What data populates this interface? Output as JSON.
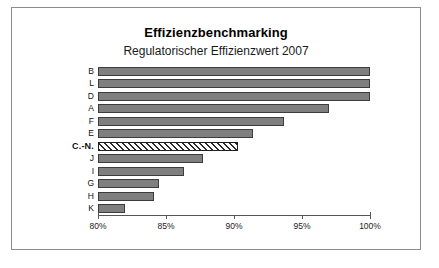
{
  "chart_data": {
    "type": "bar",
    "orientation": "horizontal",
    "title": "Effizienzbenchmarking",
    "subtitle": "Regulatorischer Effizienzwert 2007",
    "xlabel": "",
    "ylabel": "",
    "xlim": [
      80,
      100
    ],
    "grid": false,
    "legend": null,
    "xticks": [
      80,
      85,
      90,
      95,
      100
    ],
    "xtick_labels": [
      "80%",
      "85%",
      "90%",
      "95%",
      "100%"
    ],
    "categories": [
      "B",
      "L",
      "D",
      "A",
      "F",
      "E",
      "C.-N.",
      "J",
      "I",
      "G",
      "H",
      "K"
    ],
    "values": [
      100.0,
      100.0,
      100.0,
      97.0,
      93.7,
      91.4,
      90.3,
      87.7,
      86.3,
      84.5,
      84.1,
      82.0
    ],
    "highlight_category": "C.-N.",
    "highlight_style": "hatched",
    "bar_fill_color": "#7f7f7f",
    "bar_border_color": "#3c3c3c",
    "highlight_fill_color": "#ffffff",
    "highlight_hatch_color": "#2b2b2b",
    "axis_color": "#555555",
    "background_color": "#ffffff",
    "frame_border_color": "#8c8c8c"
  }
}
